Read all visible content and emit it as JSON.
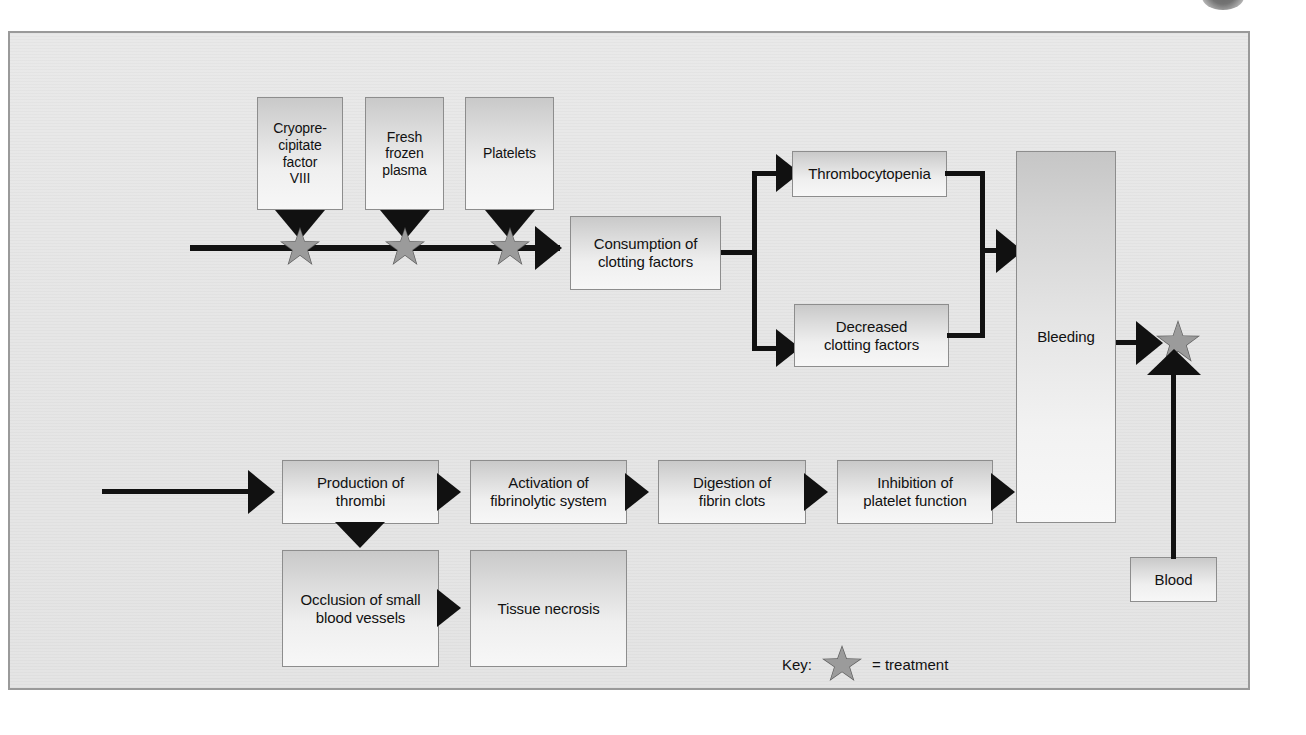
{
  "diagram": {
    "frame_border_color": "#9a9a9a",
    "background_color": "#e7e7e7",
    "line_color": "#111111",
    "star_color": "#9b9b9b",
    "nodes": {
      "cryoprecipitate": "Cryopre-\ncipitate\nfactor\nVIII",
      "fresh_frozen_plasma": "Fresh\nfrozen\nplasma",
      "platelets": "Platelets",
      "consumption": "Consumption of\nclotting factors",
      "thrombocytopenia": "Thrombocytopenia",
      "decreased_clotting": "Decreased\nclotting factors",
      "bleeding": "Bleeding",
      "blood": "Blood",
      "production_thrombi": "Production of\nthrombi",
      "activation_fibrinolytic": "Activation of\nfibrinolytic system",
      "digestion_fibrin": "Digestion of\nfibrin clots",
      "inhibition_platelet": "Inhibition of\nplatelet function",
      "occlusion_vessels": "Occlusion of small\nblood vessels",
      "tissue_necrosis": "Tissue necrosis"
    },
    "key": {
      "label": "Key:",
      "icon": "star-icon",
      "equals_text": "= treatment"
    }
  }
}
